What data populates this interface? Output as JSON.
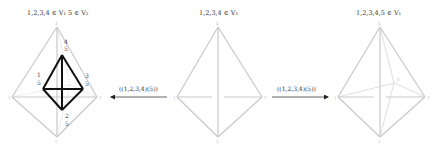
{
  "panels": [
    {
      "id": "left",
      "title": "1,2,3,4 ∈ V₁   5 ∈ V₂",
      "vertex_labels": {
        "top": "4",
        "left": "1",
        "right": "3",
        "bottom": "2"
      },
      "inner_labels": [
        {
          "top": "4",
          "bottom": "5",
          "position": "top"
        },
        {
          "top": "1",
          "bottom": "5",
          "position": "left"
        },
        {
          "top": "3",
          "bottom": "5",
          "position": "right"
        },
        {
          "top": "2",
          "bottom": "5",
          "position": "bottom"
        }
      ]
    },
    {
      "id": "middle",
      "title": "1,2,3,4 ∈ V₁",
      "vertex_labels": {
        "top": "4",
        "left": "1",
        "right": "3",
        "bottom": "2"
      }
    },
    {
      "id": "right",
      "title": "1,2,3,4,5 ∈ V₁",
      "vertex_labels": {
        "top": "4",
        "left": "1",
        "right": "3",
        "bottom": "2",
        "interior": "5"
      }
    }
  ],
  "arrows": [
    {
      "id": "to-left",
      "label": "((1,2,3,4)(5))",
      "direction": "left"
    },
    {
      "id": "to-right",
      "label": "((1,2,3,4)(5))",
      "direction": "right"
    }
  ],
  "colors": {
    "outer_edges": "#c8c8c8",
    "highlight_edges": "#111111",
    "text": "#333333"
  }
}
